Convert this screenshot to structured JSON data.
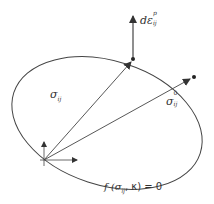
{
  "diagram": {
    "labels": {
      "strain_increment": {
        "base": "dε",
        "superscript": "p",
        "subscript": "ij"
      },
      "stress": {
        "base": "σ",
        "subscript": "ij"
      },
      "stress0": {
        "base": "σ",
        "superscript": "0",
        "subscript": "ij"
      },
      "yield_function": {
        "prefix": "f (",
        "sigma": "σ",
        "sigma_sub": "ij",
        "rest": ", κ) = 0"
      }
    },
    "colors": {
      "stroke": "#333333",
      "background": "#ffffff"
    }
  }
}
